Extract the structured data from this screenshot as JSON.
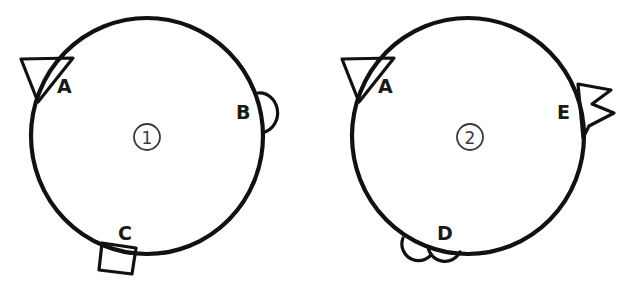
{
  "figure": {
    "background_color": "#ffffff",
    "ink_color": "#111111",
    "label_color": "#1a1a1a",
    "index_color": "#3a3a3a",
    "width": 634,
    "height": 292
  },
  "diagrams": [
    {
      "id": "diagram-1",
      "index_label": "①",
      "index_number": "1",
      "center": {
        "x": 147,
        "y": 136
      },
      "radius": 117,
      "features": [
        {
          "key": "A",
          "label": "A",
          "shape": "triangle",
          "shape_name": "downward-pointing-triangle",
          "position": "upper-left",
          "angle_deg": 205,
          "label_x": 57,
          "label_y": 93
        },
        {
          "key": "B",
          "label": "B",
          "shape": "semicircle",
          "shape_name": "half-circle-bump",
          "position": "right",
          "angle_deg": 348,
          "label_x": 236,
          "label_y": 119
        },
        {
          "key": "C",
          "label": "C",
          "shape": "square",
          "shape_name": "square-tab",
          "position": "bottom",
          "angle_deg": 100,
          "label_x": 118,
          "label_y": 240
        }
      ]
    },
    {
      "id": "diagram-2",
      "index_label": "②",
      "index_number": "2",
      "center": {
        "x": 468,
        "y": 136
      },
      "radius": 117,
      "features": [
        {
          "key": "A",
          "label": "A",
          "shape": "triangle",
          "shape_name": "downward-pointing-triangle",
          "position": "upper-left",
          "angle_deg": 205,
          "label_x": 378,
          "label_y": 93
        },
        {
          "key": "E",
          "label": "E",
          "shape": "zigzag",
          "shape_name": "jagged-zigzag-flag",
          "position": "right",
          "angle_deg": 352,
          "label_x": 557,
          "label_y": 119
        },
        {
          "key": "D",
          "label": "D",
          "shape": "double-scallop",
          "shape_name": "double-semicircle-scallop",
          "position": "bottom",
          "angle_deg": 100,
          "label_x": 437,
          "label_y": 240
        }
      ]
    }
  ]
}
